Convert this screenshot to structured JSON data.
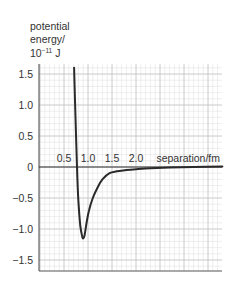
{
  "chart_data": {
    "type": "line",
    "title": "",
    "ylabel_lines": [
      "potential",
      "energy/"
    ],
    "ylabel_unit_base": "10",
    "ylabel_unit_exp": "−11",
    "ylabel_unit_suffix": "J",
    "xlabel": "separation/fm",
    "x_ticks": [
      "0.5",
      "1.0",
      "1.5",
      "2.0"
    ],
    "y_ticks": [
      "1.5",
      "1.0",
      "0.5",
      "0",
      "−0.5",
      "−1.0",
      "−1.5"
    ],
    "xlim": [
      0,
      3.8
    ],
    "ylim": [
      -1.7,
      1.7
    ],
    "grid": true,
    "legend": null,
    "series": [
      {
        "name": "potential energy",
        "x": [
          0.71,
          0.74,
          0.77,
          0.8,
          0.84,
          0.88,
          0.9,
          0.93,
          0.97,
          1.02,
          1.1,
          1.2,
          1.3,
          1.45,
          1.6,
          1.8,
          2.0,
          2.3,
          2.7,
          3.2,
          3.8
        ],
        "y": [
          1.6,
          0.8,
          0.0,
          -0.55,
          -0.95,
          -1.12,
          -1.15,
          -1.1,
          -0.9,
          -0.7,
          -0.5,
          -0.33,
          -0.2,
          -0.1,
          -0.07,
          -0.05,
          -0.035,
          -0.02,
          -0.01,
          0.0,
          0.01
        ]
      }
    ]
  }
}
